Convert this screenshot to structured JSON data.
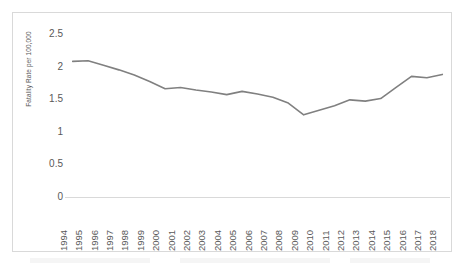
{
  "chart_data": {
    "type": "line",
    "title": "",
    "xlabel": "",
    "ylabel": "Fatality Rate per 100,000",
    "ylim": [
      0,
      2.5
    ],
    "yticks": [
      "0",
      "0.5",
      "1",
      "1.5",
      "2",
      "2.5"
    ],
    "ytick_values": [
      0,
      0.5,
      1,
      1.5,
      2,
      2.5
    ],
    "grid": false,
    "legend": "none",
    "line_color": "#808080",
    "categories": [
      "1994",
      "1995",
      "1996",
      "1997",
      "1998",
      "1999",
      "2000",
      "2001",
      "2002",
      "2003",
      "2004",
      "2005",
      "2006",
      "2007",
      "2008",
      "2009",
      "2010",
      "2011",
      "2012",
      "2013",
      "2014",
      "2015",
      "2016",
      "2017",
      "2018"
    ],
    "values": [
      2.08,
      2.09,
      2.02,
      1.95,
      1.87,
      1.77,
      1.66,
      1.68,
      1.64,
      1.61,
      1.57,
      1.62,
      1.58,
      1.53,
      1.44,
      1.26,
      1.33,
      1.4,
      1.49,
      1.47,
      1.51,
      1.68,
      1.85,
      1.83,
      1.88
    ]
  },
  "figure": {
    "border_color": "#d9d9d9",
    "background": "#ffffff",
    "text_color": "#595959"
  }
}
